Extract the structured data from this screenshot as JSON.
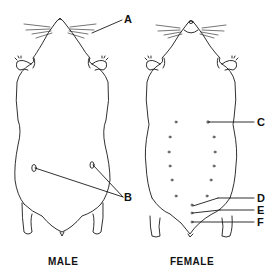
{
  "figure": {
    "panels": [
      {
        "id": "male",
        "caption": "MALE"
      },
      {
        "id": "female",
        "caption": "FEMALE"
      }
    ],
    "labels": {
      "A": "A",
      "B": "B",
      "C": "C",
      "D": "D",
      "E": "E",
      "F": "F"
    },
    "colors": {
      "line": "#1a1a1a",
      "background": "#ffffff"
    }
  }
}
